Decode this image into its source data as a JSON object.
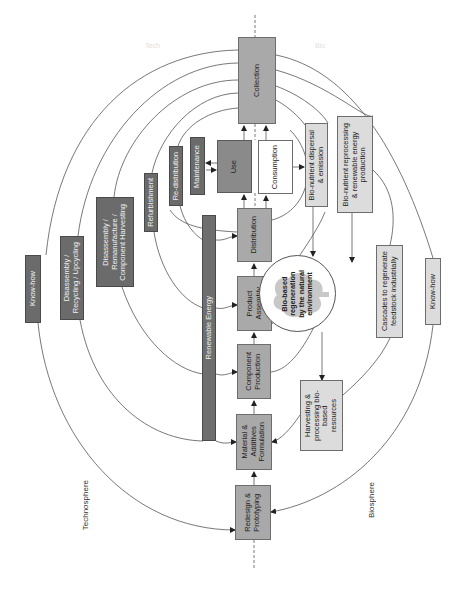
{
  "diagram": {
    "orientation": "rotated-90-ccw",
    "colors": {
      "dark_box": "#6b6b6b",
      "mid_box": "#a9a9a9",
      "light_box": "#dcdcdc",
      "use_box": "#8a8a8a",
      "line": "#555555",
      "background": "#ffffff"
    },
    "regions": {
      "technosphere": "Technosphere",
      "biosphere": "Biosphere",
      "faint_top_left": "Tech",
      "faint_top_right": "Bio"
    },
    "core_chain": [
      {
        "id": "redesign",
        "label": "Redesign &\nPrototyping"
      },
      {
        "id": "material",
        "label": "Material &\nAdditives\nFormulation"
      },
      {
        "id": "component",
        "label": "Component\nProduction"
      },
      {
        "id": "assembly",
        "label": "Product\nAssembly"
      },
      {
        "id": "distribution",
        "label": "Distribution"
      },
      {
        "id": "use",
        "label": "Use"
      },
      {
        "id": "consumption",
        "label": "Consumption"
      },
      {
        "id": "collection",
        "label": "Collection"
      }
    ],
    "technical_loops": [
      {
        "id": "maintenance",
        "label": "Maintenance"
      },
      {
        "id": "redistribution",
        "label": "Re-distribution"
      },
      {
        "id": "refurbishment",
        "label": "Refurbishment"
      },
      {
        "id": "remanufacture",
        "label": "Disassembly /\nRemanufacture /\nComponent Harvesting"
      },
      {
        "id": "recycling",
        "label": "Disassembly /\nRecycling / Upcycling"
      },
      {
        "id": "knowhow_left",
        "label": "Know-how"
      }
    ],
    "energy": {
      "label": "Renewable Energy"
    },
    "biological_loops": [
      {
        "id": "dispersal",
        "label": "Bio-nutrient dispersal\n& emission"
      },
      {
        "id": "reprocessing",
        "label": "Bio-nutrient reprocessing\n& renewable energy\nproduction"
      },
      {
        "id": "regeneration",
        "label": "Bio-based\nregeneration\nby the natural\nenvironment"
      },
      {
        "id": "harvesting",
        "label": "Harvesting &\nprocessing bio-based\nresources"
      },
      {
        "id": "cascades",
        "label": "Cascades to regenerate\nfeedstock industrially"
      },
      {
        "id": "knowhow_right",
        "label": "Know-how"
      }
    ]
  }
}
